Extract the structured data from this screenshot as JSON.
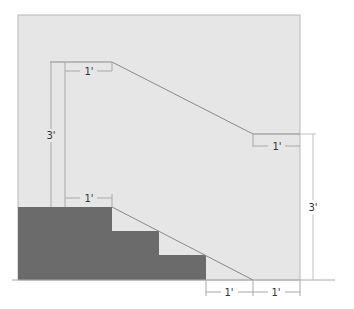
{
  "diagram": {
    "type": "stair handrail elevation",
    "colors": {
      "background": "#ffffff",
      "wall_panel": "#e6e6e6",
      "stairs": "#6b6b6b",
      "lines": "#8a8a8a",
      "dimension_lines": "#a8a8a8",
      "text": "#333333"
    },
    "dimensions": {
      "top_extension": "1'",
      "left_height": "3'",
      "bottom_extension": "1'",
      "right_landing_extension": "1'",
      "right_height": "3'",
      "bottom_run_1": "1'",
      "bottom_run_2": "1'"
    }
  }
}
